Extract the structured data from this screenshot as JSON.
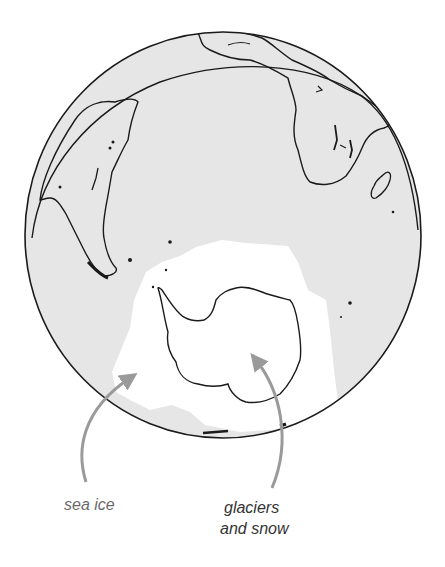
{
  "figure": {
    "colors": {
      "ocean_land": "#e6e6e6",
      "ice": "#ffffff",
      "outline": "#1a1a1a",
      "arrow": "#9a9a9a",
      "label_sea_ice": "#6b6b6b",
      "label_glaciers": "#333333"
    }
  },
  "labels": {
    "sea_ice": "sea ice",
    "glaciers_line1": "glaciers",
    "glaciers_line2": "and snow"
  },
  "regions": [
    "South America",
    "Africa",
    "Madagascar",
    "Antarctica",
    "Sea ice"
  ]
}
